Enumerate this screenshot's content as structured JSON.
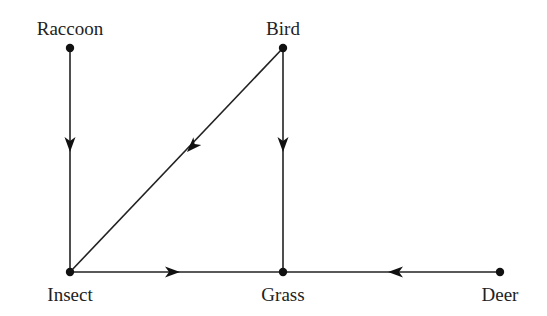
{
  "diagram": {
    "type": "directed-graph",
    "title": "",
    "nodes": [
      {
        "id": "raccoon",
        "label": "Raccoon",
        "x": 70,
        "y": 48,
        "label_x": 70,
        "label_y": 35,
        "anchor": "middle"
      },
      {
        "id": "bird",
        "label": "Bird",
        "x": 283,
        "y": 48,
        "label_x": 283,
        "label_y": 35,
        "anchor": "middle"
      },
      {
        "id": "insect",
        "label": "Insect",
        "x": 70,
        "y": 272,
        "label_x": 70,
        "label_y": 301,
        "anchor": "middle"
      },
      {
        "id": "grass",
        "label": "Grass",
        "x": 283,
        "y": 272,
        "label_x": 283,
        "label_y": 301,
        "anchor": "middle"
      },
      {
        "id": "deer",
        "label": "Deer",
        "x": 500,
        "y": 272,
        "label_x": 500,
        "label_y": 301,
        "anchor": "middle"
      }
    ],
    "edges": [
      {
        "from": "raccoon",
        "to": "insect",
        "arrow_at": [
          70,
          152
        ],
        "direction": "down"
      },
      {
        "from": "bird",
        "to": "insect",
        "arrow_at": [
          187,
          152
        ],
        "direction": "down-left"
      },
      {
        "from": "bird",
        "to": "grass",
        "arrow_at": [
          283,
          152
        ],
        "direction": "down"
      },
      {
        "from": "insect",
        "to": "grass",
        "arrow_at": [
          180,
          272
        ],
        "direction": "right"
      },
      {
        "from": "deer",
        "to": "grass",
        "arrow_at": [
          388,
          272
        ],
        "direction": "left"
      }
    ],
    "colors": {
      "line": "#222222",
      "node": "#111111",
      "text": "#222222",
      "background": "#ffffff"
    }
  }
}
